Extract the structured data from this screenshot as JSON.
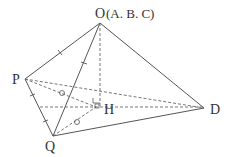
{
  "diagram": {
    "type": "pyramid-net-folded",
    "points": {
      "O": {
        "label": "O",
        "x": 100,
        "y": 23
      },
      "P": {
        "label": "P",
        "x": 25,
        "y": 79
      },
      "Q": {
        "label": "Q",
        "x": 53,
        "y": 136
      },
      "D": {
        "label": "D",
        "x": 204,
        "y": 108
      },
      "H": {
        "label": "H",
        "x": 96,
        "y": 107
      }
    },
    "labels": {
      "O": "O",
      "O_note": "(A. B. C)",
      "P": "P",
      "Q": "Q",
      "D": "D",
      "H": "H"
    },
    "edges_solid": [
      "O-P",
      "O-Q",
      "O-D",
      "P-Q",
      "Q-D"
    ],
    "edges_dashed": [
      "P-D",
      "O-H",
      "P-H",
      "Q-H",
      "horizontal-to-D"
    ],
    "marks": {
      "equal_ticks_single": [
        "O-P",
        "O-Q"
      ],
      "equal_ticks_double": [
        "P-Q"
      ],
      "circle_marks": [
        "P-H",
        "Q-H"
      ],
      "right_angle": "H"
    },
    "colors": {
      "line": "#555555",
      "text": "#333333"
    }
  }
}
